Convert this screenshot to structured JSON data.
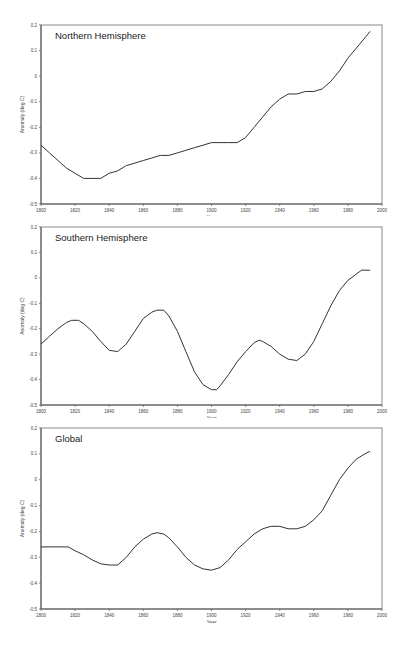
{
  "chart_data": [
    {
      "type": "line",
      "title": "Northern Hemisphere",
      "xlabel": "Year",
      "ylabel": "Anomaly (deg C)",
      "xlim": [
        1800,
        2000
      ],
      "ylim": [
        -0.5,
        0.2
      ],
      "xticks": [
        "1800",
        "1820",
        "1840",
        "1860",
        "1880",
        "1900",
        "1920",
        "1940",
        "1960",
        "1980",
        "2000"
      ],
      "yticks": [
        "0.2",
        "0.1",
        "0",
        "-0.1",
        "-0.2",
        "-0.3",
        "-0.4",
        "-0.5"
      ],
      "grid": false,
      "x": [
        1800,
        1805,
        1810,
        1815,
        1820,
        1825,
        1830,
        1835,
        1840,
        1845,
        1850,
        1855,
        1860,
        1865,
        1870,
        1875,
        1880,
        1885,
        1890,
        1895,
        1900,
        1905,
        1910,
        1915,
        1920,
        1925,
        1930,
        1935,
        1940,
        1945,
        1950,
        1955,
        1960,
        1965,
        1970,
        1975,
        1980,
        1985,
        1990,
        1993
      ],
      "values": [
        -0.27,
        -0.3,
        -0.33,
        -0.36,
        -0.38,
        -0.4,
        -0.4,
        -0.4,
        -0.38,
        -0.37,
        -0.35,
        -0.34,
        -0.33,
        -0.32,
        -0.31,
        -0.31,
        -0.3,
        -0.29,
        -0.28,
        -0.27,
        -0.26,
        -0.26,
        -0.26,
        -0.26,
        -0.24,
        -0.2,
        -0.16,
        -0.12,
        -0.09,
        -0.07,
        -0.07,
        -0.06,
        -0.06,
        -0.05,
        -0.02,
        0.02,
        0.07,
        0.11,
        0.15,
        0.175
      ]
    },
    {
      "type": "line",
      "title": "Southern Hemisphere",
      "xlabel": "Year",
      "ylabel": "Anomaly (deg C)",
      "xlim": [
        1800,
        2000
      ],
      "ylim": [
        -0.5,
        0.2
      ],
      "xticks": [
        "1800",
        "1820",
        "1840",
        "1860",
        "1880",
        "1900",
        "1920",
        "1940",
        "1960",
        "1980",
        "2000"
      ],
      "yticks": [
        "0.2",
        "0.1",
        "0",
        "-0.1",
        "-0.2",
        "-0.3",
        "-0.4",
        "-0.5"
      ],
      "grid": false,
      "x": [
        1800,
        1805,
        1810,
        1815,
        1818,
        1822,
        1825,
        1830,
        1835,
        1840,
        1845,
        1850,
        1855,
        1860,
        1865,
        1868,
        1872,
        1875,
        1880,
        1885,
        1890,
        1895,
        1900,
        1903,
        1905,
        1910,
        1915,
        1920,
        1925,
        1928,
        1930,
        1935,
        1940,
        1945,
        1950,
        1955,
        1960,
        1965,
        1970,
        1975,
        1980,
        1985,
        1988,
        1990,
        1993
      ],
      "values": [
        -0.26,
        -0.23,
        -0.2,
        -0.175,
        -0.167,
        -0.167,
        -0.18,
        -0.21,
        -0.25,
        -0.285,
        -0.29,
        -0.26,
        -0.21,
        -0.16,
        -0.135,
        -0.127,
        -0.127,
        -0.15,
        -0.21,
        -0.29,
        -0.37,
        -0.42,
        -0.44,
        -0.44,
        -0.425,
        -0.38,
        -0.33,
        -0.29,
        -0.255,
        -0.245,
        -0.25,
        -0.27,
        -0.3,
        -0.32,
        -0.325,
        -0.3,
        -0.25,
        -0.18,
        -0.11,
        -0.05,
        -0.01,
        0.015,
        0.03,
        0.03,
        0.03
      ]
    },
    {
      "type": "line",
      "title": "Global",
      "xlabel": "Year",
      "ylabel": "Anomaly (deg C)",
      "xlim": [
        1800,
        2000
      ],
      "ylim": [
        -0.5,
        0.2
      ],
      "xticks": [
        "1800",
        "1820",
        "1840",
        "1860",
        "1880",
        "1900",
        "1920",
        "1940",
        "1960",
        "1980",
        "2000"
      ],
      "yticks": [
        "0.2",
        "0.1",
        "0",
        "-0.1",
        "-0.2",
        "-0.3",
        "-0.4",
        "-0.5"
      ],
      "grid": false,
      "x": [
        1800,
        1805,
        1810,
        1816,
        1820,
        1825,
        1830,
        1835,
        1840,
        1845,
        1850,
        1855,
        1860,
        1865,
        1868,
        1872,
        1875,
        1880,
        1885,
        1890,
        1895,
        1900,
        1905,
        1910,
        1915,
        1920,
        1925,
        1930,
        1935,
        1940,
        1945,
        1950,
        1955,
        1960,
        1965,
        1970,
        1975,
        1980,
        1985,
        1990,
        1993
      ],
      "values": [
        -0.26,
        -0.26,
        -0.26,
        -0.26,
        -0.275,
        -0.29,
        -0.31,
        -0.325,
        -0.33,
        -0.33,
        -0.3,
        -0.26,
        -0.23,
        -0.21,
        -0.205,
        -0.21,
        -0.225,
        -0.26,
        -0.3,
        -0.33,
        -0.345,
        -0.35,
        -0.34,
        -0.31,
        -0.27,
        -0.24,
        -0.21,
        -0.19,
        -0.18,
        -0.18,
        -0.19,
        -0.19,
        -0.18,
        -0.155,
        -0.12,
        -0.06,
        0.0,
        0.045,
        0.08,
        0.1,
        0.11
      ]
    }
  ]
}
